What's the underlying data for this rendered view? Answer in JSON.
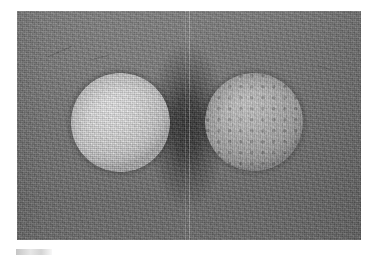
{
  "figure": {
    "kind": "grayscale-photograph",
    "plate": {
      "x": 17,
      "y": 11,
      "width": 344,
      "height": 229,
      "background_tone": "#747474",
      "border": "none",
      "page_background": "#ffffff"
    },
    "objects": [
      {
        "id": "sphere-left",
        "label": "left sphere",
        "surface": "smooth",
        "tone": "bright",
        "highlight_color": "#ececed",
        "shadow_color": "#a9a9aa",
        "center_x": 103,
        "center_y": 111,
        "diameter": 99
      },
      {
        "id": "sphere-right",
        "label": "right sphere",
        "surface": "dimpled",
        "tone": "medium",
        "highlight_color": "#c9c9c9",
        "shadow_color": "#838384",
        "center_x": 237,
        "center_y": 111,
        "diameter": 98
      }
    ],
    "artifacts": {
      "center_shadow": "dark vertical shadow band between the two spheres",
      "scan_lines": [
        {
          "id": "scan-line-primary",
          "x": 172,
          "opacity": "bright"
        },
        {
          "id": "scan-line-secondary",
          "x": 168,
          "opacity": "dim"
        }
      ],
      "scratches": [
        {
          "id": "scratch-upper-left",
          "x": 30,
          "y": 40,
          "length": 26,
          "angle": -24
        },
        {
          "id": "scratch-upper-mid",
          "x": 74,
          "y": 46,
          "length": 18,
          "angle": -14
        },
        {
          "id": "scratch-right",
          "x": 300,
          "y": 56,
          "length": 14,
          "angle": 20
        }
      ],
      "caption_mark": "faint light mark below lower-left of the plate"
    }
  }
}
